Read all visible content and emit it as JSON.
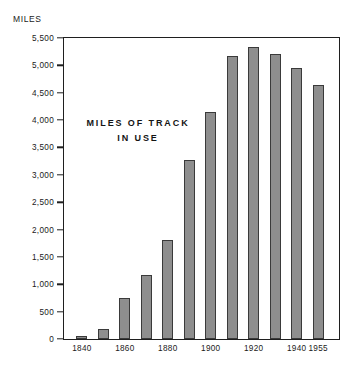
{
  "chart_data": {
    "type": "bar",
    "title": "",
    "subtitle": "",
    "xlabel": "",
    "ylabel": "MILES",
    "annotation": "MILES OF TRACK IN USE",
    "annotation_lines": [
      "MILES OF TRACK",
      "IN USE"
    ],
    "grid": false,
    "legend": "none",
    "ylim": [
      0,
      5500
    ],
    "ytick_step": 500,
    "ytick_labels": [
      "5,500",
      "5,000",
      "4,500",
      "4,000",
      "3,500",
      "3,000",
      "2,500",
      "2,000",
      "1,500",
      "1,000",
      "500",
      "0"
    ],
    "ytick_values": [
      5500,
      5000,
      4500,
      4000,
      3500,
      3000,
      2500,
      2000,
      1500,
      1000,
      500,
      0
    ],
    "xtick_labels": [
      "1840",
      "1860",
      "1880",
      "1900",
      "1920",
      "1940",
      "1955"
    ],
    "xtick_values": [
      1840,
      1860,
      1880,
      1900,
      1920,
      1940,
      1955
    ],
    "categories": [
      "1840",
      "1850",
      "1860",
      "1870",
      "1880",
      "1890",
      "1900",
      "1910",
      "1920",
      "1930",
      "1940",
      "1955"
    ],
    "values": [
      60,
      190,
      750,
      1170,
      1810,
      3280,
      4150,
      5180,
      5330,
      5200,
      4950,
      4650
    ],
    "bar_color": "#8e8e8e",
    "bar_edge_color": "#3a3a3a",
    "frame_color": "#1f1f1f",
    "background_color": "#ffffff"
  }
}
